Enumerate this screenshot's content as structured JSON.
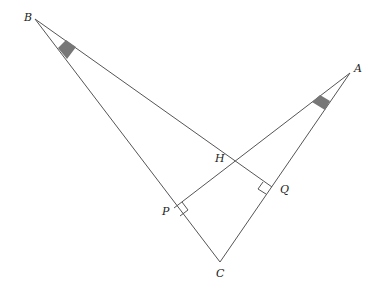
{
  "diagram": {
    "type": "triangle-orthocenter",
    "points": {
      "A": {
        "label": "A",
        "x": 350,
        "y": 73
      },
      "B": {
        "label": "B",
        "x": 35,
        "y": 19
      },
      "C": {
        "label": "C",
        "x": 220,
        "y": 262
      },
      "H": {
        "label": "H",
        "x": 236,
        "y": 156
      },
      "P": {
        "label": "P",
        "x": 174,
        "y": 208
      },
      "Q": {
        "label": "Q",
        "x": 271,
        "y": 187
      }
    },
    "segments": [
      [
        "B",
        "C"
      ],
      [
        "A",
        "C"
      ],
      [
        "B",
        "Q"
      ],
      [
        "A",
        "P"
      ]
    ],
    "right_angles": [
      "P",
      "Q"
    ],
    "equal_angle_marks": [
      "B",
      "A"
    ],
    "colors": {
      "line": "#555555",
      "mark": "#777777"
    }
  },
  "labels": {
    "A": "A",
    "B": "B",
    "C": "C",
    "H": "H",
    "P": "P",
    "Q": "Q"
  }
}
